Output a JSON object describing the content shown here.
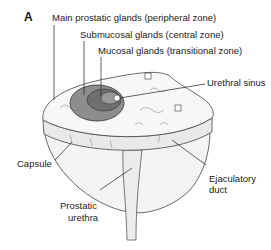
{
  "figure": {
    "panel_letter": "A",
    "labels": {
      "main_glands": "Main prostatic glands (peripheral zone)",
      "submucosal_glands": "Submucosal glands (central zone)",
      "mucosal_glands": "Mucosal glands (transitional zone)",
      "urethral_sinus": "Urethral sinus",
      "capsule": "Capsule",
      "ejaculatory_duct_line1": "Ejaculatory",
      "ejaculatory_duct_line2": "duct",
      "prostatic_urethra_line1": "Prostatic",
      "prostatic_urethra_line2": "urethra"
    }
  }
}
